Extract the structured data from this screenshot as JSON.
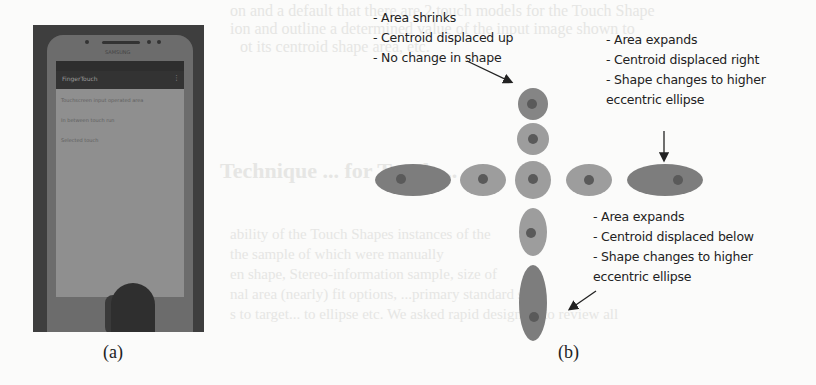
{
  "background_text": {
    "line1": "on and a default that there are 2 touch models for the Touch Shape",
    "line2": "ion and outline a determined value of the input image shown to",
    "line3": "ot its centroid shape area, etc.",
    "heading": "Technique ... for Touch ...",
    "line5": "ability of the Touch Shapes instances of the",
    "line6": "the sample of which were manually",
    "line7": "en shape, Stereo-information sample, size of",
    "line8": "nal area (nearly) fit options, ...primary standard sh",
    "line9": "s to target... to ellipse etc. We asked rapid designers to review all",
    "line10": "",
    "line11": ""
  },
  "figure_a": {
    "caption": "(a)",
    "phone": {
      "brand": "SAMSUNG",
      "app_title": "FingerTouch",
      "menu_glyph": "⋮",
      "screen_lines": [
        "Touchscreen input operated area",
        "In between touch run",
        "Selected touch"
      ]
    }
  },
  "figure_b": {
    "caption": "(b)",
    "annotations": {
      "top": [
        "- Area shrinks",
        "- Centroid displaced up",
        "- No change in shape"
      ],
      "right": [
        "- Area expands",
        "- Centroid displaced right",
        "- Shape changes to higher",
        "eccentric ellipse"
      ],
      "bottom": [
        "- Area expands",
        "- Centroid displaced below",
        "- Shape changes to higher",
        "eccentric ellipse"
      ]
    },
    "colors": {
      "light_blob": "#9d9d9d",
      "dark_blob": "#7d7d7d",
      "centroid": "#5a5a5a",
      "arrow": "#222222"
    },
    "shapes": [
      {
        "id": "up-2",
        "cx": 533,
        "cy": 104,
        "rx": 15,
        "ry": 16,
        "fill": "#858585",
        "dot_x": 532,
        "dot_y": 104
      },
      {
        "id": "up-1",
        "cx": 533,
        "cy": 139,
        "rx": 16,
        "ry": 16,
        "fill": "#9d9d9d",
        "dot_x": 533,
        "dot_y": 139
      },
      {
        "id": "center",
        "cx": 533,
        "cy": 180,
        "rx": 18,
        "ry": 19,
        "fill": "#9d9d9d",
        "dot_x": 533,
        "dot_y": 179
      },
      {
        "id": "left-1",
        "cx": 483,
        "cy": 180,
        "rx": 23,
        "ry": 16,
        "fill": "#9d9d9d",
        "dot_x": 483,
        "dot_y": 179
      },
      {
        "id": "left-2",
        "cx": 413,
        "cy": 180,
        "rx": 38,
        "ry": 16,
        "fill": "#7d7d7d",
        "dot_x": 401,
        "dot_y": 179
      },
      {
        "id": "right-1",
        "cx": 589,
        "cy": 180,
        "rx": 23,
        "ry": 16,
        "fill": "#9d9d9d",
        "dot_x": 589,
        "dot_y": 180
      },
      {
        "id": "right-2",
        "cx": 665,
        "cy": 180,
        "rx": 38,
        "ry": 16,
        "fill": "#7d7d7d",
        "dot_x": 678,
        "dot_y": 180
      },
      {
        "id": "down-1",
        "cx": 533,
        "cy": 232,
        "rx": 14,
        "ry": 24,
        "fill": "#9d9d9d",
        "dot_x": 531,
        "dot_y": 233
      },
      {
        "id": "down-2",
        "cx": 533,
        "cy": 303,
        "rx": 14,
        "ry": 38,
        "fill": "#7d7d7d",
        "dot_x": 534,
        "dot_y": 317
      }
    ]
  }
}
